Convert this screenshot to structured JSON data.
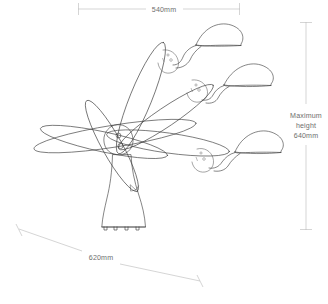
{
  "drawing": {
    "title": "Articulated three-head lamp sculpture elevation",
    "line_color": "#3a3a3a",
    "dimension_color": "#b9b9b9",
    "dimension_text_color": "#6e6e6e",
    "background": "#ffffff"
  },
  "dimensions": {
    "top": {
      "label": "540mm",
      "orientation": "horizontal",
      "position": "top"
    },
    "bottom": {
      "label": "620mm",
      "orientation": "diagonal",
      "position": "bottom-left"
    },
    "right": {
      "label_line1": "Maximum",
      "label_line2": "height",
      "label_line3": "640mm",
      "label_full": "Maximum height 640mm",
      "orientation": "vertical",
      "position": "right"
    }
  },
  "parts": {
    "base": "flared-conical-base",
    "hub": "central-pivot-hub",
    "hub_holes": 2,
    "arms": [
      {
        "name": "arm-upper-left-ellipse"
      },
      {
        "name": "arm-mid-ellipse"
      },
      {
        "name": "arm-lower-ellipse"
      },
      {
        "name": "arm-upper-right-to-head-1"
      },
      {
        "name": "arm-mid-right-to-head-2"
      },
      {
        "name": "arm-lower-right-to-head-3"
      }
    ],
    "heads": [
      {
        "name": "lamp-head-top"
      },
      {
        "name": "lamp-head-middle"
      },
      {
        "name": "lamp-head-bottom"
      }
    ],
    "feet": 4
  }
}
